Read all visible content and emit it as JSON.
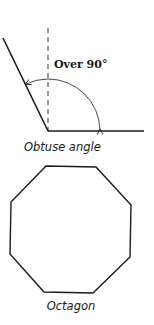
{
  "diagram": {
    "obtuse_angle": {
      "angle_label": "Over 90°",
      "caption": "Obtuse angle"
    },
    "octagon": {
      "caption": "Octagon"
    },
    "colors": {
      "stroke": "#1a1a1a",
      "background": "#ffffff"
    }
  }
}
